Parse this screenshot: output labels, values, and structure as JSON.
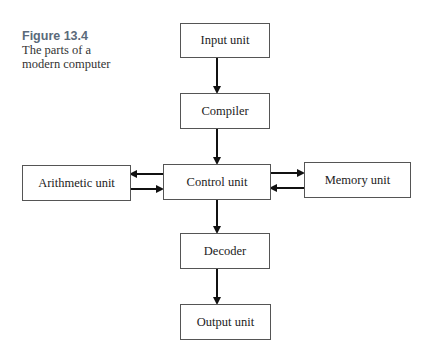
{
  "caption": {
    "number": "Figure 13.4",
    "line1": "The parts of a",
    "line2": "modern computer"
  },
  "nodes": {
    "input": "Input unit",
    "compiler": "Compiler",
    "control": "Control unit",
    "arithmetic": "Arithmetic unit",
    "memory": "Memory unit",
    "decoder": "Decoder",
    "output": "Output unit"
  },
  "edges": [
    {
      "from": "Input unit",
      "to": "Compiler"
    },
    {
      "from": "Compiler",
      "to": "Control unit"
    },
    {
      "from": "Control unit",
      "to": "Arithmetic unit"
    },
    {
      "from": "Arithmetic unit",
      "to": "Control unit"
    },
    {
      "from": "Control unit",
      "to": "Memory unit"
    },
    {
      "from": "Memory unit",
      "to": "Control unit"
    },
    {
      "from": "Control unit",
      "to": "Decoder"
    },
    {
      "from": "Decoder",
      "to": "Output unit"
    }
  ]
}
